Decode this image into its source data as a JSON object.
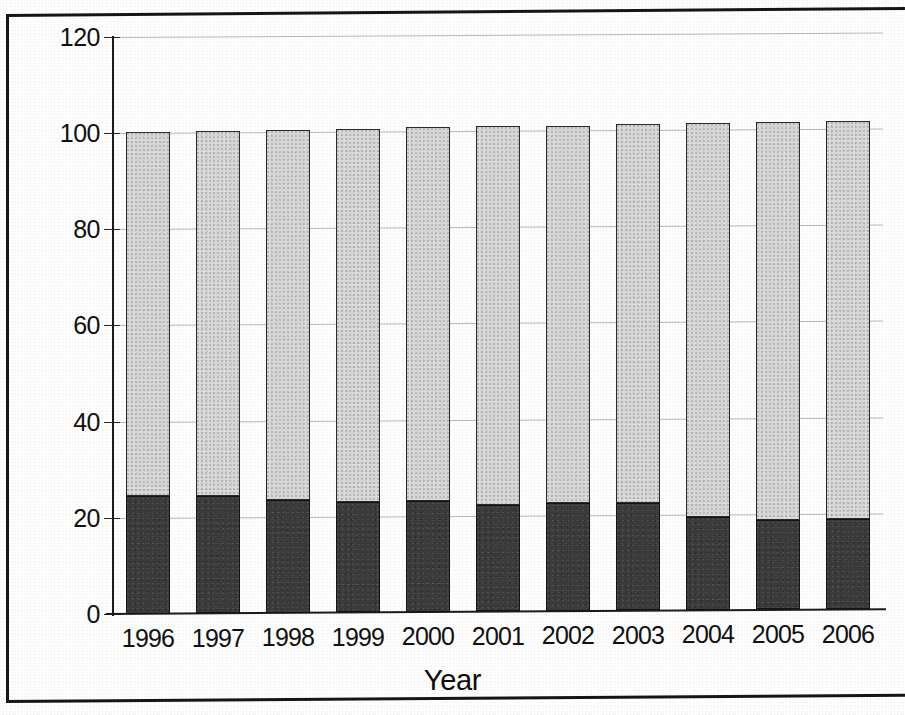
{
  "chart_data": {
    "type": "bar",
    "subtype": "stacked-bar-100",
    "title": "",
    "xlabel": "Year",
    "ylabel": "Percent",
    "categories": [
      "1996",
      "1997",
      "1998",
      "1999",
      "2000",
      "2001",
      "2002",
      "2003",
      "2004",
      "2005",
      "2006"
    ],
    "series": [
      {
        "name": "dark-segment",
        "color": "#3b3b3b",
        "values": [
          24.5,
          24.5,
          23.5,
          23.0,
          23.0,
          22.0,
          22.3,
          22.3,
          19.3,
          18.5,
          18.7
        ]
      },
      {
        "name": "light-segment",
        "color": "#d9d9d9",
        "values": [
          75.8,
          75.8,
          76.8,
          77.4,
          77.7,
          78.8,
          78.5,
          78.7,
          81.9,
          82.8,
          82.7
        ]
      }
    ],
    "totals": [
      100.3,
      100.3,
      100.3,
      100.4,
      100.7,
      100.8,
      100.8,
      101.0,
      101.2,
      101.3,
      101.4
    ],
    "ylim": [
      0,
      120
    ],
    "yticks": [
      0,
      20,
      40,
      60,
      80,
      100,
      120
    ],
    "ytick_labels": [
      "0",
      "20",
      "40",
      "60",
      "80",
      "100",
      "120"
    ],
    "grid": true,
    "grid_axis": "y",
    "legend": false,
    "legend_position": "none"
  },
  "axes": {
    "y_title": "Percent",
    "x_title": "Year",
    "y_ticks": [
      {
        "value": 120,
        "label": "120"
      },
      {
        "value": 100,
        "label": "100"
      },
      {
        "value": 80,
        "label": "80"
      },
      {
        "value": 60,
        "label": "60"
      },
      {
        "value": 40,
        "label": "40"
      },
      {
        "value": 20,
        "label": "20"
      },
      {
        "value": 0,
        "label": "0"
      }
    ],
    "x_ticks": [
      {
        "label": "1996"
      },
      {
        "label": "1997"
      },
      {
        "label": "1998"
      },
      {
        "label": "1999"
      },
      {
        "label": "2000"
      },
      {
        "label": "2001"
      },
      {
        "label": "2002"
      },
      {
        "label": "2003"
      },
      {
        "label": "2004"
      },
      {
        "label": "2005"
      },
      {
        "label": "2006"
      }
    ]
  },
  "colors": {
    "dark_segment": "#3b3b3b",
    "light_segment": "#d9d9d9",
    "axis": "#1b1b1b",
    "gridline": "#b9b9b9",
    "frame": "#151515",
    "text": "#111111",
    "background": "#fefefe"
  }
}
